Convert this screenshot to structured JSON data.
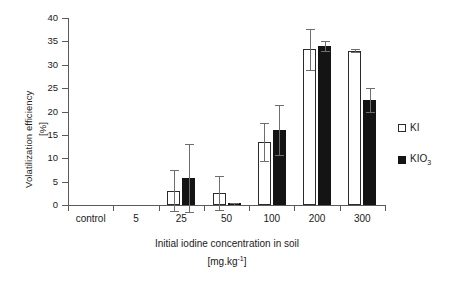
{
  "chart_data": {
    "type": "bar",
    "title": "",
    "xlabel": "Initial iodine concentration in soil [mg.kg-1]",
    "xlabel_line1": "Initial iodine concentration in soil",
    "xlabel_line2_prefix": "[mg.kg",
    "xlabel_line2_sup": "-1",
    "xlabel_line2_suffix": "]",
    "ylabel": "Volatilization efficiency [%]",
    "ylabel_line1": "Volatilization efficiency",
    "ylabel_line2": "[%]",
    "categories": [
      "control",
      "5",
      "25",
      "50",
      "100",
      "200",
      "300"
    ],
    "ylim": [
      0,
      40
    ],
    "ytick_values": [
      0,
      5,
      10,
      15,
      20,
      25,
      30,
      35,
      40
    ],
    "ytick_labels": [
      "0",
      "5",
      "10",
      "15",
      "20",
      "25",
      "30",
      "35",
      "40"
    ],
    "grid": false,
    "legend_position": "right",
    "series": [
      {
        "name": "KI",
        "color": "#ffffff",
        "edge_color": "#2b2b2b",
        "values": [
          0,
          0,
          3.1,
          2.5,
          13.5,
          33.3,
          33.0
        ],
        "errors": [
          0,
          0,
          4.3,
          3.6,
          4.0,
          4.4,
          0.3
        ]
      },
      {
        "name": "KIO3",
        "name_base": "KIO",
        "name_sub": "3",
        "color": "#141414",
        "edge_color": "#141414",
        "values": [
          0,
          0,
          5.8,
          0.3,
          16.0,
          34.0,
          22.5
        ],
        "errors": [
          0,
          0,
          7.2,
          0.2,
          5.3,
          1.0,
          2.6
        ]
      }
    ]
  }
}
